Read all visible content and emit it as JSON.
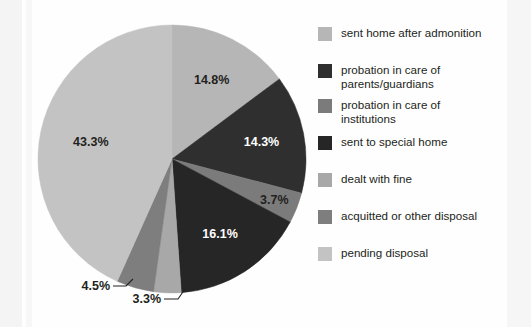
{
  "chart_data": {
    "type": "pie",
    "title": "",
    "subtitle": "",
    "xlabel": "",
    "ylabel": "",
    "legend_position": "right",
    "grid": false,
    "start_angle_deg": 0,
    "direction": "clockwise",
    "categories": [
      "sent home after admonition",
      "probation in care of\nparents/guardians",
      "probation in care of\ninstitutions",
      "sent to special home",
      "dealt with fine",
      "acquitted or other disposal",
      "pending disposal"
    ],
    "values": [
      14.8,
      14.3,
      3.7,
      16.1,
      3.3,
      4.5,
      43.3
    ],
    "value_labels": [
      "14.8%",
      "14.3%",
      "3.7%",
      "16.1%",
      "3.3%",
      "4.5%",
      "43.3%"
    ],
    "unit": "%",
    "colors": [
      "#b6b6b6",
      "#2f2f2f",
      "#7b7b7b",
      "#262626",
      "#a8a8a8",
      "#7e7e7e",
      "#c3c3c3"
    ],
    "slices": [
      {
        "label": "sent home after admonition",
        "value": 14.8,
        "value_label": "14.8%",
        "color": "#b6b6b6",
        "label_style": "inside-dark-text",
        "callout": false
      },
      {
        "label": "probation in care of parents/guardians",
        "value": 14.3,
        "value_label": "14.3%",
        "color": "#2f2f2f",
        "label_style": "inside-light-text",
        "callout": false
      },
      {
        "label": "probation in care of institutions",
        "value": 3.7,
        "value_label": "3.7%",
        "color": "#7b7b7b",
        "label_style": "inside-dark-text",
        "callout": false
      },
      {
        "label": "sent to special home",
        "value": 16.1,
        "value_label": "16.1%",
        "color": "#262626",
        "label_style": "inside-light-text",
        "callout": false
      },
      {
        "label": "dealt with fine",
        "value": 3.3,
        "value_label": "3.3%",
        "color": "#a8a8a8",
        "label_style": "callout",
        "callout": true
      },
      {
        "label": "acquitted or other disposal",
        "value": 4.5,
        "value_label": "4.5%",
        "color": "#7e7e7e",
        "label_style": "callout",
        "callout": true
      },
      {
        "label": "pending disposal",
        "value": 43.3,
        "value_label": "43.3%",
        "color": "#c3c3c3",
        "label_style": "inside-dark-text",
        "callout": false
      }
    ]
  },
  "pie": {
    "labels": {
      "s1": "14.8%",
      "s2": "14.3%",
      "s3": "3.7%",
      "s4": "16.1%",
      "s5": "3.3%",
      "s6": "4.5%",
      "s7": "43.3%"
    }
  },
  "legend": {
    "items": [
      {
        "label": "sent home after admonition",
        "color": "#b6b6b6"
      },
      {
        "label": "probation in care of\nparents/guardians",
        "color": "#2f2f2f"
      },
      {
        "label": "probation in care of\ninstitutions",
        "color": "#7b7b7b"
      },
      {
        "label": "sent to special home",
        "color": "#262626"
      },
      {
        "label": "dealt with fine",
        "color": "#a8a8a8"
      },
      {
        "label": "acquitted or other disposal",
        "color": "#7e7e7e"
      },
      {
        "label": "pending disposal",
        "color": "#c3c3c3"
      }
    ]
  }
}
